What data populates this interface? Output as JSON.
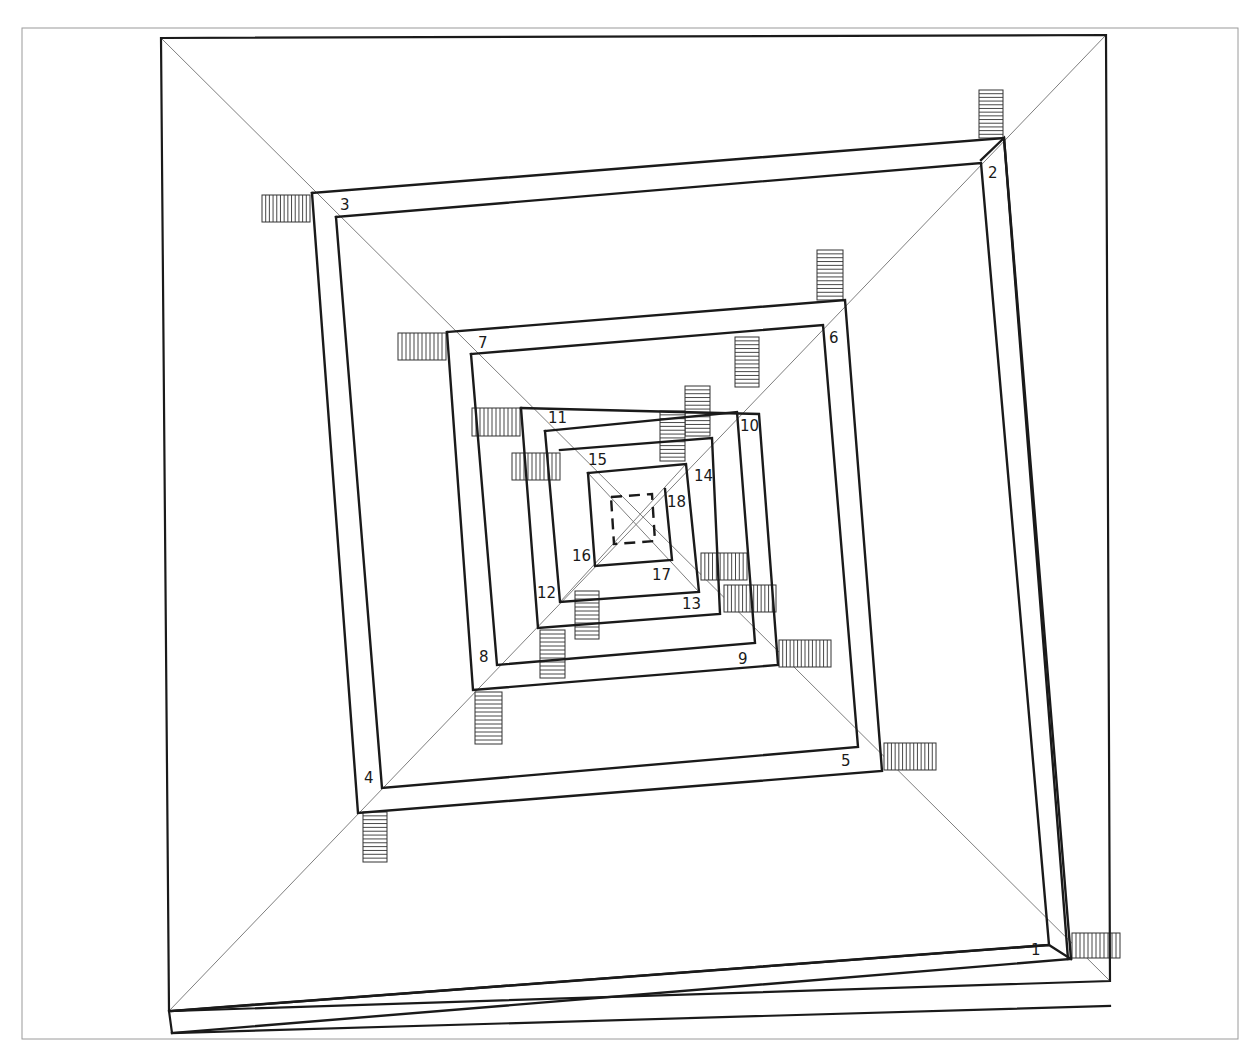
{
  "diagram": {
    "type": "square-spiral-plan",
    "colors": {
      "ink": "#1a1a1a",
      "frame": "#9a9a9a",
      "construction": "#6f6f6f",
      "background": "#ffffff"
    },
    "frame": {
      "x": 22,
      "y": 28,
      "w": 1216,
      "h": 1011
    },
    "outer_square": {
      "points": [
        [
          161,
          38
        ],
        [
          1106,
          35
        ],
        [
          1110,
          981
        ],
        [
          169,
          1011
        ]
      ]
    },
    "outer_square_bottom_strip": {
      "points": [
        [
          169,
          1011
        ],
        [
          172,
          1033
        ],
        [
          1110,
          1006
        ]
      ]
    },
    "diagonals": [
      {
        "from": [
          161,
          38
        ],
        "to": [
          1110,
          981
        ]
      },
      {
        "from": [
          1106,
          35
        ],
        "to": [
          169,
          1011
        ]
      }
    ],
    "spiral_walls": [
      {
        "id": "w1",
        "points": [
          [
            1071,
            959
          ],
          [
            1049,
            945
          ],
          [
            170,
            1011
          ]
        ]
      },
      {
        "id": "w-outer-right",
        "points": [
          [
            1068,
            959
          ],
          [
            1004,
            138
          ],
          [
            981,
            160
          ]
        ]
      },
      {
        "id": "ring-1-outer",
        "points": [
          [
            312,
            193
          ],
          [
            1004,
            138
          ],
          [
            1071,
            959
          ],
          [
            172,
            1033
          ]
        ]
      },
      {
        "id": "ring-1-inner",
        "points": [
          [
            336,
            217
          ],
          [
            981,
            163
          ],
          [
            1049,
            945
          ],
          [
            172,
            1011
          ]
        ]
      },
      {
        "id": "ring-2-outer",
        "points": [
          [
            312,
            193
          ],
          [
            358,
            813
          ],
          [
            882,
            771
          ],
          [
            845,
            300
          ],
          [
            447,
            332
          ]
        ]
      },
      {
        "id": "ring-2-inner",
        "points": [
          [
            336,
            217
          ],
          [
            382,
            788
          ],
          [
            858,
            747
          ],
          [
            823,
            325
          ],
          [
            471,
            354
          ]
        ]
      },
      {
        "id": "ring-3-outer",
        "points": [
          [
            447,
            332
          ],
          [
            473,
            690
          ],
          [
            778,
            665
          ],
          [
            759,
            414
          ],
          [
            521,
            408
          ]
        ]
      },
      {
        "id": "ring-3-inner",
        "points": [
          [
            471,
            354
          ],
          [
            497,
            665
          ],
          [
            755,
            643
          ],
          [
            737,
            412
          ],
          [
            545,
            431
          ]
        ]
      },
      {
        "id": "ring-4-outer",
        "points": [
          [
            521,
            408
          ],
          [
            538,
            628
          ],
          [
            720,
            614
          ],
          [
            712,
            438
          ],
          [
            560,
            450
          ]
        ]
      },
      {
        "id": "ring-4-inner",
        "points": [
          [
            545,
            431
          ],
          [
            560,
            602
          ],
          [
            699,
            592
          ],
          [
            686,
            464
          ],
          [
            588,
            473
          ]
        ]
      },
      {
        "id": "ring-5",
        "points": [
          [
            588,
            473
          ],
          [
            595,
            566
          ],
          [
            672,
            560
          ],
          [
            665,
            489
          ]
        ]
      }
    ],
    "center_square_dashed": {
      "points": [
        [
          611,
          497
        ],
        [
          652,
          494
        ],
        [
          655,
          541
        ],
        [
          614,
          544
        ]
      ]
    },
    "center_diagonals": [
      {
        "from": [
          588,
          473
        ],
        "to": [
          699,
          592
        ]
      },
      {
        "from": [
          686,
          464
        ],
        "to": [
          560,
          602
        ]
      }
    ],
    "stairs": [
      {
        "id": "stair-1",
        "x": 1072,
        "y": 933,
        "w": 48,
        "h": 25,
        "orient": "vertical-lines",
        "count": 12
      },
      {
        "id": "stair-2",
        "x": 979,
        "y": 90,
        "w": 24,
        "h": 48,
        "orient": "horizontal-lines",
        "count": 13
      },
      {
        "id": "stair-3",
        "x": 262,
        "y": 195,
        "w": 48,
        "h": 27,
        "orient": "vertical-lines",
        "count": 13
      },
      {
        "id": "stair-4",
        "x": 363,
        "y": 812,
        "w": 24,
        "h": 50,
        "orient": "horizontal-lines",
        "count": 13
      },
      {
        "id": "stair-5",
        "x": 884,
        "y": 743,
        "w": 52,
        "h": 27,
        "orient": "vertical-lines",
        "count": 14
      },
      {
        "id": "stair-6",
        "x": 817,
        "y": 250,
        "w": 26,
        "h": 50,
        "orient": "horizontal-lines",
        "count": 13
      },
      {
        "id": "stair-7",
        "x": 398,
        "y": 333,
        "w": 48,
        "h": 27,
        "orient": "vertical-lines",
        "count": 12
      },
      {
        "id": "stair-8",
        "x": 475,
        "y": 692,
        "w": 27,
        "h": 52,
        "orient": "horizontal-lines",
        "count": 13
      },
      {
        "id": "stair-9",
        "x": 779,
        "y": 640,
        "w": 52,
        "h": 27,
        "orient": "vertical-lines",
        "count": 14
      },
      {
        "id": "stair-10",
        "x": 735,
        "y": 337,
        "w": 24,
        "h": 50,
        "orient": "horizontal-lines",
        "count": 13
      },
      {
        "id": "stair-11",
        "x": 472,
        "y": 408,
        "w": 48,
        "h": 28,
        "orient": "vertical-lines",
        "count": 12
      },
      {
        "id": "stair-12",
        "x": 540,
        "y": 630,
        "w": 25,
        "h": 48,
        "orient": "horizontal-lines",
        "count": 12
      },
      {
        "id": "stair-13",
        "x": 724,
        "y": 585,
        "w": 52,
        "h": 27,
        "orient": "vertical-lines",
        "count": 14
      },
      {
        "id": "stair-14",
        "x": 685,
        "y": 386,
        "w": 25,
        "h": 50,
        "orient": "horizontal-lines",
        "count": 13
      },
      {
        "id": "stair-15",
        "x": 512,
        "y": 453,
        "w": 48,
        "h": 27,
        "orient": "vertical-lines",
        "count": 12
      },
      {
        "id": "stair-16",
        "x": 575,
        "y": 591,
        "w": 24,
        "h": 48,
        "orient": "horizontal-lines",
        "count": 12
      },
      {
        "id": "stair-17",
        "x": 701,
        "y": 553,
        "w": 46,
        "h": 27,
        "orient": "vertical-lines",
        "count": 12
      },
      {
        "id": "stair-18",
        "x": 660,
        "y": 411,
        "w": 25,
        "h": 50,
        "orient": "horizontal-lines",
        "count": 13
      }
    ],
    "labels": [
      {
        "text": "1",
        "x": 1031,
        "y": 955
      },
      {
        "text": "2",
        "x": 988,
        "y": 178
      },
      {
        "text": "3",
        "x": 340,
        "y": 210
      },
      {
        "text": "4",
        "x": 364,
        "y": 783
      },
      {
        "text": "5",
        "x": 841,
        "y": 766
      },
      {
        "text": "6",
        "x": 829,
        "y": 343
      },
      {
        "text": "7",
        "x": 478,
        "y": 348
      },
      {
        "text": "8",
        "x": 479,
        "y": 662
      },
      {
        "text": "9",
        "x": 738,
        "y": 664
      },
      {
        "text": "10",
        "x": 740,
        "y": 431
      },
      {
        "text": "11",
        "x": 548,
        "y": 423
      },
      {
        "text": "12",
        "x": 537,
        "y": 598
      },
      {
        "text": "13",
        "x": 682,
        "y": 609
      },
      {
        "text": "14",
        "x": 694,
        "y": 481
      },
      {
        "text": "15",
        "x": 588,
        "y": 465
      },
      {
        "text": "16",
        "x": 572,
        "y": 561
      },
      {
        "text": "17",
        "x": 652,
        "y": 580
      },
      {
        "text": "18",
        "x": 667,
        "y": 507
      }
    ]
  }
}
